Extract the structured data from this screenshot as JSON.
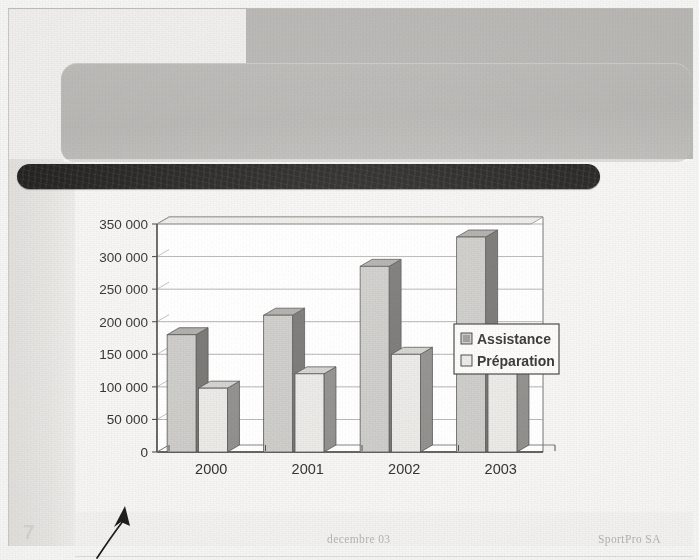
{
  "slide": {
    "number": "7",
    "title_redacted": true,
    "title_placeholder": "",
    "footer": {
      "date": "decembre 03",
      "organization": "SportPro SA"
    },
    "annotation": {
      "type": "hand-drawn-arrow",
      "color": "#1c1b19"
    }
  },
  "colors": {
    "page_background": "#f0efed",
    "header_block": "#b5b4b1",
    "title_placeholder": "#b8b7b4",
    "redaction_bar": "#1b1a18",
    "plot_background": "#ffffff",
    "gridline": "#8e8d8a",
    "axis": "#4a4947",
    "series_assistance_front": "#c9c8c5",
    "series_assistance_side": "#6f6e6b",
    "series_assistance_top": "#a9a8a5",
    "series_preparation_front": "#e8e7e4",
    "series_preparation_side": "#8a8986",
    "series_preparation_top": "#cfcecb",
    "legend_border": "#3d3c3a",
    "text": "#2b2a28",
    "footer_text": "#b2b0ad"
  },
  "chart_data": {
    "type": "bar",
    "title": "",
    "subtitle": "",
    "xlabel": "",
    "ylabel": "",
    "categories": [
      "2000",
      "2001",
      "2002",
      "2003"
    ],
    "series": [
      {
        "name": "Assistance",
        "values": [
          180000,
          210000,
          285000,
          330000
        ]
      },
      {
        "name": "Préparation",
        "values": [
          98000,
          120000,
          150000,
          185000
        ]
      }
    ],
    "ylim": [
      0,
      350000
    ],
    "ytick_step": 50000,
    "ytick_labels": [
      "0",
      "50 000",
      "100 000",
      "150 000",
      "200 000",
      "250 000",
      "300 000",
      "350 000"
    ],
    "ytick_values": [
      0,
      50000,
      100000,
      150000,
      200000,
      250000,
      300000,
      350000
    ],
    "grid": true,
    "grid_axis": "y",
    "legend_position": "right",
    "three_d": true,
    "legend_entries": [
      {
        "label": "Assistance",
        "swatch": "filled-gray"
      },
      {
        "label": "Préparation",
        "swatch": "light-gray"
      }
    ]
  }
}
